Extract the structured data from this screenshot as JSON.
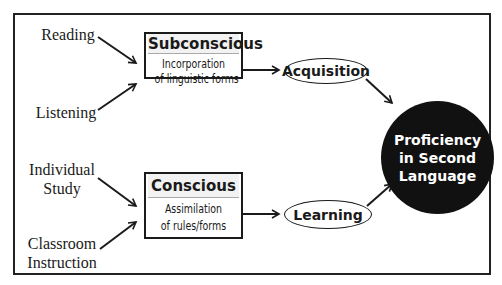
{
  "diagram": {
    "inputs_top": [
      {
        "label": "Reading"
      },
      {
        "label": "Listening"
      }
    ],
    "inputs_bottom": [
      {
        "label_line1": "Individual",
        "label_line2": "Study"
      },
      {
        "label_line1": "Classroom",
        "label_line2": "Instruction"
      }
    ],
    "subconscious_box": {
      "title": "Subconscious",
      "line1": "Incorporation",
      "line2": "of linguistic forms"
    },
    "conscious_box": {
      "title": "Conscious",
      "line1": "Assimilation",
      "line2": "of rules/forms"
    },
    "acquisition": {
      "label": "Acquisition"
    },
    "learning": {
      "label": "Learning"
    },
    "outcome": {
      "line1": "Proficiency",
      "line2": "in Second",
      "line3": "Language"
    },
    "colors": {
      "ink": "#1a1a1a",
      "outcome_fill": "#111111",
      "outcome_text": "#ffffff",
      "background": "#ffffff"
    }
  }
}
